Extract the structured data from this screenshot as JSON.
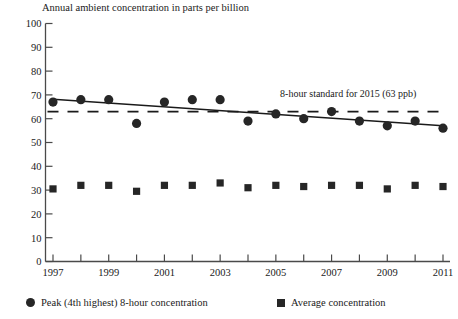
{
  "chart_data": {
    "type": "scatter",
    "title": "Annual ambient concentration in parts per billion",
    "xlabel": "",
    "ylabel": "",
    "ylim": [
      0,
      100
    ],
    "ytick_step": 10,
    "yticks": [
      "0",
      "10",
      "20",
      "30",
      "40",
      "50",
      "60",
      "70",
      "80",
      "90",
      "100"
    ],
    "xlim": [
      1997,
      2011
    ],
    "x": [
      1997,
      1998,
      1999,
      2000,
      2001,
      2002,
      2003,
      2004,
      2005,
      2006,
      2007,
      2008,
      2009,
      2010,
      2011
    ],
    "xticks": [
      1997,
      1998,
      1999,
      2000,
      2001,
      2002,
      2003,
      2004,
      2005,
      2006,
      2007,
      2008,
      2009,
      2010,
      2011
    ],
    "xtick_labels": [
      "1997",
      "",
      "1999",
      "",
      "2001",
      "",
      "2003",
      "",
      "2005",
      "",
      "2007",
      "",
      "2009",
      "",
      "2011"
    ],
    "grid": false,
    "legend_position": "bottom",
    "series": [
      {
        "name": "Peak (4th highest) 8-hour concentration",
        "marker": "circle",
        "color": "#262626",
        "values": [
          67,
          68,
          68,
          58,
          67,
          68,
          68,
          59,
          62,
          60,
          63,
          59,
          57,
          59,
          56
        ]
      },
      {
        "name": "Average concentration",
        "marker": "square",
        "color": "#262626",
        "values": [
          30.5,
          32,
          32,
          29.5,
          32,
          32,
          33,
          31,
          32,
          31.5,
          32,
          32,
          30.5,
          32,
          31.5
        ]
      }
    ],
    "trendline": {
      "name": "peak-trend",
      "from": [
        1997,
        68.2
      ],
      "to": [
        2011,
        57.0
      ],
      "color": "#1a1a1a"
    },
    "reference_line": {
      "name": "8-hour standard",
      "value": 63,
      "style": "dashed",
      "label": "8-hour standard for 2015 (63 ppb)",
      "color": "#1a1a1a"
    },
    "annotations": [
      {
        "text": "8-hour standard for 2015 (63 ppb)",
        "x": 2007.6,
        "y": 69
      }
    ]
  },
  "legend": {
    "peak_label": "Peak (4th highest) 8-hour concentration",
    "avg_label": "Average concentration"
  },
  "axis": {
    "y_labels": [
      "100",
      "90",
      "80",
      "70",
      "60",
      "50",
      "40",
      "30",
      "20",
      "10",
      "0"
    ],
    "x_labels": [
      "1997",
      "1999",
      "2001",
      "2003",
      "2005",
      "2007",
      "2009",
      "2011"
    ]
  }
}
